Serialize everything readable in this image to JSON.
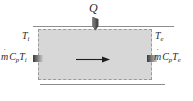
{
  "figure": {
    "fill_color": "#d7d7d7",
    "line_color": "#8d8d8d",
    "boundary_style": "dashed",
    "text_color": "#2b2b2b"
  },
  "labels": {
    "heat_input": {
      "symbol": "Q",
      "dot": "˙",
      "full": "Q̇",
      "meaning": "heat-transfer-rate"
    },
    "inlet_temperature": {
      "symbol": "T",
      "subscript": "i",
      "full": "Tᵢ"
    },
    "exit_temperature": {
      "symbol": "T",
      "subscript": "e",
      "full": "Tₑ"
    },
    "inlet_enthalpy_flux": {
      "mass_flow": "m",
      "mass_flow_dot": "˙",
      "specific_heat": "C",
      "specific_heat_subscript": "p",
      "temperature": "T",
      "temperature_subscript": "i",
      "full": "ṁ Cₚ Tᵢ"
    },
    "exit_enthalpy_flux": {
      "mass_flow": "m",
      "mass_flow_dot": "˙",
      "specific_heat": "C",
      "specific_heat_subscript": "p",
      "temperature": "T",
      "temperature_subscript": "e",
      "full": "ṁ Cₚ Tₑ"
    }
  },
  "markers": {
    "flow_direction": "right",
    "heat_direction": "into-control-volume",
    "inlet_port": "inlet-flow-marker",
    "outlet_port": "outlet-flow-marker"
  }
}
